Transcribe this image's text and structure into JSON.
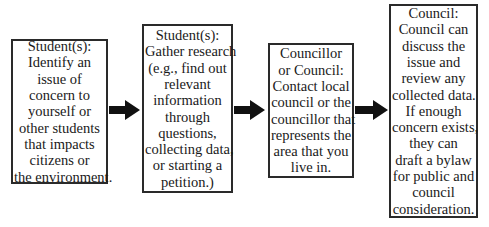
{
  "diagram": {
    "type": "flowchart",
    "direction": "left-to-right",
    "steps": [
      {
        "id": "step-1",
        "title": "Student(s):",
        "lines": [
          "Student(s):",
          "Identify an",
          "issue of",
          "concern to",
          "yourself or",
          "other students",
          "that impacts",
          "citizens or",
          "the environment."
        ]
      },
      {
        "id": "step-2",
        "title": "Student(s):",
        "lines": [
          "Student(s):",
          "Gather research",
          "(e.g., find out",
          "relevant",
          "information",
          "through",
          "questions,",
          "collecting data,",
          "or starting a",
          "petition.)"
        ]
      },
      {
        "id": "step-3",
        "title": "Councillor or Council:",
        "lines": [
          "Councillor",
          "or Council:",
          "Contact local",
          "council or the",
          "councillor that",
          "represents the",
          "area that you",
          "live in."
        ]
      },
      {
        "id": "step-4",
        "title": "Council:",
        "lines": [
          "Council:",
          "Council can",
          "discuss the",
          "issue and",
          "review any",
          "collected data.",
          "If enough",
          "concern exists,",
          "they can",
          "draft a bylaw",
          "for public and",
          "council",
          "consideration."
        ]
      }
    ],
    "connectors": [
      {
        "from": "step-1",
        "to": "step-2",
        "icon": "right-arrow-icon"
      },
      {
        "from": "step-2",
        "to": "step-3",
        "icon": "right-arrow-icon"
      },
      {
        "from": "step-3",
        "to": "step-4",
        "icon": "right-arrow-icon"
      }
    ],
    "colors": {
      "border": "#2a2a2a",
      "arrow": "#111111",
      "text": "#1a1a1a",
      "background": "#ffffff"
    }
  }
}
